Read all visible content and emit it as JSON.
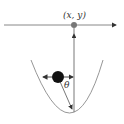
{
  "diagram": {
    "point_label": "(x, y)",
    "angle_label": "θ",
    "colors": {
      "line": "#7a7a7a",
      "curve": "#8a8a8a",
      "point": "#777777",
      "ball": "#111111",
      "arrow": "#333333"
    },
    "elements": {
      "horizontal_axis": {
        "x1": 4,
        "y1": 25,
        "x2": 118,
        "y2": 25,
        "arrow": "right"
      },
      "pivot_point": {
        "cx": 74,
        "cy": 25,
        "r": 3
      },
      "vertical_line": {
        "x": 74,
        "y_top": 28,
        "y_bottom": 112,
        "arrow": "up"
      },
      "parabola": {
        "left": [
          31,
          60
        ],
        "vertex": [
          72,
          113
        ],
        "right": [
          103,
          60
        ]
      },
      "ball": {
        "cx": 58,
        "cy": 77,
        "r": 6,
        "arrows": [
          "left",
          "right"
        ]
      },
      "pendulum_line": {
        "from": [
          58,
          77
        ],
        "to": [
          72,
          110
        ],
        "arrow": "end"
      }
    }
  }
}
